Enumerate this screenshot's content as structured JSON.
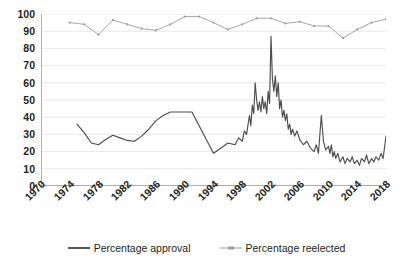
{
  "chart_data": {
    "type": "line",
    "title": "",
    "subtitle": "",
    "xlabel": "",
    "ylabel": "",
    "xlim": [
      1970,
      2018
    ],
    "ylim": [
      0,
      100
    ],
    "grid": true,
    "legend_position": "bottom",
    "y_ticks": [
      0,
      10,
      20,
      30,
      40,
      50,
      60,
      70,
      80,
      90,
      100
    ],
    "x_tick_labels": [
      "1970",
      "1974",
      "1978",
      "1982",
      "1986",
      "1990",
      "1994",
      "1998",
      "2002",
      "2006",
      "2010",
      "2014",
      "2018"
    ],
    "x_tick_values": [
      1970,
      1974,
      1978,
      1982,
      1986,
      1990,
      1994,
      1998,
      2002,
      2006,
      2010,
      2014,
      2018
    ],
    "x_minor_tick_values": [
      1970,
      1972,
      1974,
      1976,
      1978,
      1980,
      1982,
      1984,
      1986,
      1988,
      1990,
      1992,
      1994,
      1996,
      1998,
      2000,
      2002,
      2004,
      2006,
      2008,
      2010,
      2012,
      2014,
      2016,
      2018
    ],
    "series": [
      {
        "name": "Percentage approval",
        "color": "#4d4d4d",
        "marker": "none",
        "x": [
          1975,
          1976,
          1977,
          1978,
          1979,
          1980,
          1981,
          1982,
          1983,
          1984,
          1985,
          1986,
          1987,
          1988,
          1989,
          1990,
          1991,
          1992,
          1993,
          1994,
          1995,
          1996,
          1997,
          1997.5,
          1998,
          1998.3,
          1998.6,
          1999,
          1999.2,
          1999.4,
          1999.6,
          1999.8,
          2000,
          2000.2,
          2000.4,
          2000.6,
          2000.8,
          2001,
          2001.2,
          2001.4,
          2001.6,
          2001.8,
          2002,
          2002.2,
          2002.4,
          2002.6,
          2002.8,
          2003,
          2003.2,
          2003.4,
          2003.6,
          2003.8,
          2004,
          2004.2,
          2004.4,
          2004.6,
          2004.8,
          2005,
          2005.3,
          2005.6,
          2006,
          2006.5,
          2007,
          2007.5,
          2008,
          2008.3,
          2008.6,
          2009,
          2009.3,
          2009.6,
          2010,
          2010.2,
          2010.4,
          2010.6,
          2010.8,
          2011,
          2011.3,
          2011.6,
          2012,
          2012.3,
          2012.6,
          2013,
          2013.3,
          2013.6,
          2014,
          2014.3,
          2014.6,
          2015,
          2015.3,
          2015.6,
          2016,
          2016.3,
          2016.6,
          2017,
          2017.3,
          2017.6,
          2018
        ],
        "values": [
          36,
          31,
          25,
          24,
          27,
          29.5,
          28,
          26.5,
          26,
          29,
          33,
          38,
          41,
          43,
          43,
          43,
          43,
          35,
          27,
          19,
          22,
          25,
          24,
          28,
          26,
          32,
          30,
          41,
          35,
          47,
          42,
          60,
          50,
          44,
          49,
          43,
          52,
          45,
          49,
          42,
          55,
          48,
          87,
          62,
          55,
          64,
          52,
          60,
          45,
          50,
          40,
          44,
          38,
          42,
          33,
          36,
          30,
          33,
          29,
          32,
          27,
          24,
          26,
          22,
          20,
          24,
          19,
          41,
          26,
          21,
          23,
          19,
          24,
          17,
          20,
          16,
          19,
          14,
          17,
          13,
          16,
          14,
          17,
          13,
          15,
          12,
          16,
          14,
          18,
          13,
          16,
          14,
          17,
          15,
          19,
          16,
          29
        ]
      },
      {
        "name": "Percentage reelected",
        "color": "#9d9d9d",
        "marker": "dot",
        "x": [
          1974,
          1976,
          1978,
          1980,
          1982,
          1984,
          1986,
          1988,
          1990,
          1992,
          1994,
          1996,
          1998,
          2000,
          2002,
          2004,
          2006,
          2008,
          2010,
          2012,
          2014,
          2016,
          2018
        ],
        "values": [
          95,
          94,
          88,
          96.5,
          94,
          91.5,
          90.5,
          94,
          98.5,
          98.5,
          95,
          91,
          94,
          97.5,
          97.5,
          94.5,
          95.5,
          93,
          93,
          86,
          91,
          95,
          97
        ]
      }
    ]
  },
  "legend": {
    "items": [
      {
        "label": "Percentage approval",
        "color": "#4d4d4d",
        "style": "line"
      },
      {
        "label": "Percentage reelected",
        "color": "#9d9d9d",
        "style": "line-marker"
      }
    ]
  },
  "axes": {
    "axis_color": "#a6a6a6",
    "grid_color": "#e2e2e2",
    "tick_label_color": "#231f20"
  }
}
